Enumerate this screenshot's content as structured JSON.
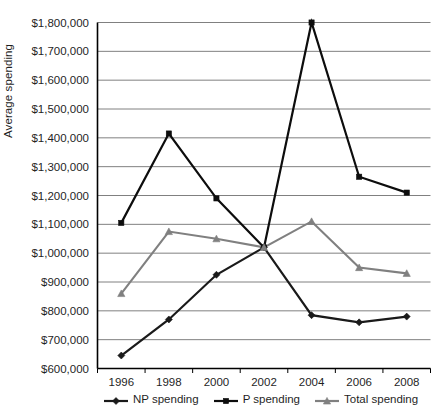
{
  "chart_data": {
    "type": "line",
    "title": "",
    "xlabel": "",
    "ylabel": "Average spending",
    "categories": [
      "1996",
      "1998",
      "2000",
      "2002",
      "2004",
      "2006",
      "2008"
    ],
    "ylim": [
      600000,
      1800000
    ],
    "ytick_step": 100000,
    "ytick_labels": [
      "$1,800,000",
      "$1,700,000",
      "$1,600,000",
      "$1,500,000",
      "$1,400,000",
      "$1,300,000",
      "$1,200,000",
      "$1,100,000",
      "$1,000,000",
      "$900,000",
      "$800,000",
      "$700,000",
      "$600,000"
    ],
    "ytick_values": [
      1800000,
      1700000,
      1600000,
      1500000,
      1400000,
      1300000,
      1200000,
      1100000,
      1000000,
      900000,
      800000,
      700000,
      600000
    ],
    "grid": "horizontal",
    "legend_position": "bottom",
    "series": [
      {
        "name": "NP spending",
        "marker": "diamond",
        "color": "#1a1a1a",
        "values": [
          645000,
          770000,
          925000,
          1020000,
          785000,
          760000,
          780000
        ]
      },
      {
        "name": "P spending",
        "marker": "square",
        "color": "#0d0d0d",
        "values": [
          1105000,
          1415000,
          1190000,
          1020000,
          1800000,
          1265000,
          1210000
        ]
      },
      {
        "name": "Total spending",
        "marker": "triangle",
        "color": "#808080",
        "values": [
          860000,
          1075000,
          1050000,
          1020000,
          1110000,
          950000,
          930000
        ]
      }
    ]
  },
  "axes": {
    "y_title": "Average spending"
  },
  "legend": {
    "entries": [
      {
        "label": "NP spending",
        "marker": "diamond-marker",
        "color": "#1a1a1a"
      },
      {
        "label": "P spending",
        "marker": "square-marker",
        "color": "#0d0d0d"
      },
      {
        "label": "Total spending",
        "marker": "triangle-marker",
        "color": "#808080"
      }
    ]
  },
  "style": {
    "grid_color": "#808080",
    "axis_color": "#000000",
    "plot_background": "#ffffff"
  }
}
